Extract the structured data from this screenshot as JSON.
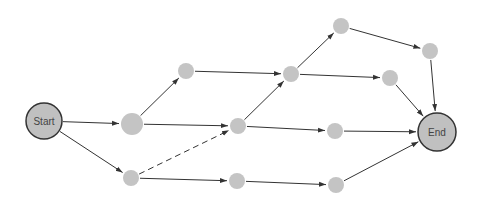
{
  "diagram": {
    "type": "network",
    "colors": {
      "node_fill": "#c4c4c4",
      "terminal_fill": "#c0c0c0",
      "terminal_stroke": "#333333",
      "edge": "#333333",
      "label": "#444444"
    },
    "nodes": [
      {
        "id": "start",
        "label": "Start",
        "x": 44,
        "y": 121,
        "r": 18,
        "terminal": true
      },
      {
        "id": "n1",
        "label": "",
        "x": 132,
        "y": 124,
        "r": 11
      },
      {
        "id": "n2",
        "label": "",
        "x": 131,
        "y": 178,
        "r": 8
      },
      {
        "id": "n3",
        "label": "",
        "x": 186,
        "y": 71,
        "r": 8
      },
      {
        "id": "n4",
        "label": "",
        "x": 238,
        "y": 126,
        "r": 8
      },
      {
        "id": "n5",
        "label": "",
        "x": 237,
        "y": 181,
        "r": 8
      },
      {
        "id": "n6",
        "label": "",
        "x": 291,
        "y": 74,
        "r": 8
      },
      {
        "id": "n7",
        "label": "",
        "x": 341,
        "y": 26,
        "r": 8
      },
      {
        "id": "n8",
        "label": "",
        "x": 335,
        "y": 131,
        "r": 8
      },
      {
        "id": "n9",
        "label": "",
        "x": 336,
        "y": 185,
        "r": 8
      },
      {
        "id": "n10",
        "label": "",
        "x": 390,
        "y": 78,
        "r": 8
      },
      {
        "id": "n11",
        "label": "",
        "x": 430,
        "y": 51,
        "r": 8
      },
      {
        "id": "end",
        "label": "End",
        "x": 437,
        "y": 132,
        "r": 19,
        "terminal": true
      }
    ],
    "edges": [
      {
        "from": "start",
        "to": "n1",
        "dashed": false
      },
      {
        "from": "start",
        "to": "n2",
        "dashed": false
      },
      {
        "from": "n1",
        "to": "n3",
        "dashed": false
      },
      {
        "from": "n1",
        "to": "n4",
        "dashed": false
      },
      {
        "from": "n2",
        "to": "n4",
        "dashed": true
      },
      {
        "from": "n2",
        "to": "n5",
        "dashed": false
      },
      {
        "from": "n3",
        "to": "n6",
        "dashed": false
      },
      {
        "from": "n4",
        "to": "n6",
        "dashed": false
      },
      {
        "from": "n4",
        "to": "n8",
        "dashed": false
      },
      {
        "from": "n5",
        "to": "n9",
        "dashed": false
      },
      {
        "from": "n6",
        "to": "n7",
        "dashed": false
      },
      {
        "from": "n6",
        "to": "n10",
        "dashed": false
      },
      {
        "from": "n7",
        "to": "n11",
        "dashed": false
      },
      {
        "from": "n11",
        "to": "end",
        "dashed": false
      },
      {
        "from": "n10",
        "to": "end",
        "dashed": false
      },
      {
        "from": "n8",
        "to": "end",
        "dashed": false
      },
      {
        "from": "n9",
        "to": "end",
        "dashed": false
      }
    ]
  }
}
